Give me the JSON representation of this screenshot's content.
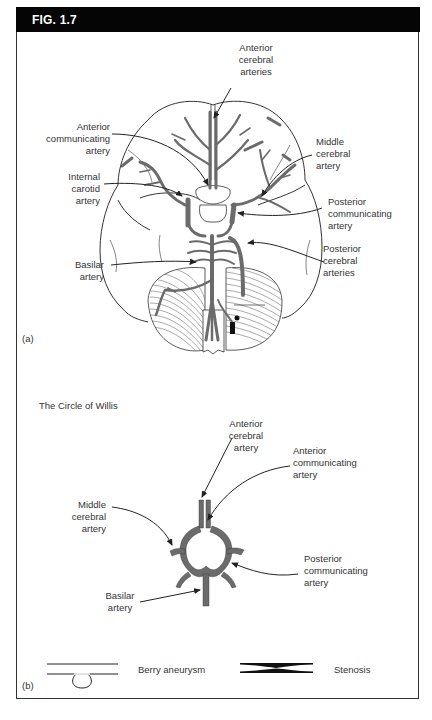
{
  "figure": {
    "title": "FIG. 1.7"
  },
  "panel_a": {
    "tag": "(a)",
    "labels": {
      "anterior_cerebral_arteries": [
        "Anterior",
        "cerebral",
        "arteries"
      ],
      "anterior_communicating_artery": [
        "Anterior",
        "communicating",
        "artery"
      ],
      "middle_cerebral_artery": [
        "Middle",
        "cerebral",
        "artery"
      ],
      "internal_carotid_artery": [
        "Internal",
        "carotid",
        "artery"
      ],
      "posterior_communicating_artery": [
        "Posterior",
        "communicating",
        "artery"
      ],
      "posterior_cerebral_arteries": [
        "Posterior",
        "cerebral",
        "arteries"
      ],
      "basilar_artery": [
        "Basilar",
        "artery"
      ]
    }
  },
  "panel_b": {
    "tag": "(b)",
    "subtitle": "The Circle of Willis",
    "labels": {
      "anterior_cerebral_artery": [
        "Anterior",
        "cerebral",
        "artery"
      ],
      "anterior_communicating_artery": [
        "Anterior",
        "communicating",
        "artery"
      ],
      "middle_cerebral_artery": [
        "Middle",
        "cerebral",
        "artery"
      ],
      "posterior_communicating_artery": [
        "Posterior",
        "communicating",
        "artery"
      ],
      "basilar_artery": [
        "Basilar",
        "artery"
      ]
    },
    "legend": {
      "berry_aneurysm": "Berry aneurysm",
      "stenosis": "Stenosis"
    }
  },
  "colors": {
    "header_bg": "#050505",
    "vessel_fill": "#6b6b6b",
    "outline": "#333333",
    "text": "#333333"
  }
}
